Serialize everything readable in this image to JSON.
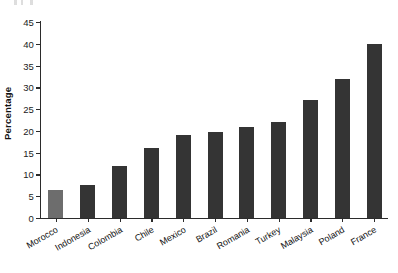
{
  "chart_data": {
    "type": "bar",
    "title": "",
    "subtitle": "",
    "xlabel": "",
    "ylabel": "Percentage",
    "ylim": [
      0,
      45
    ],
    "yticks": [
      0,
      5,
      10,
      15,
      20,
      25,
      30,
      35,
      40,
      45
    ],
    "grid": false,
    "legend": null,
    "categories": [
      "Morocco",
      "Indonesia",
      "Colombia",
      "Chile",
      "Mexico",
      "Brazil",
      "Romania",
      "Turkey",
      "Malaysia",
      "Poland",
      "France"
    ],
    "values": [
      6.5,
      7.5,
      12,
      16,
      19,
      19.7,
      21,
      22,
      27,
      32,
      40
    ],
    "bar_colors": [
      "#6d6d6d",
      "#343434",
      "#343434",
      "#343434",
      "#343434",
      "#343434",
      "#343434",
      "#343434",
      "#343434",
      "#343434",
      "#343434"
    ],
    "highlight_category": "Morocco",
    "axis_color": "#2b2b2b",
    "text_color": "#111111",
    "background": "#ffffff"
  }
}
